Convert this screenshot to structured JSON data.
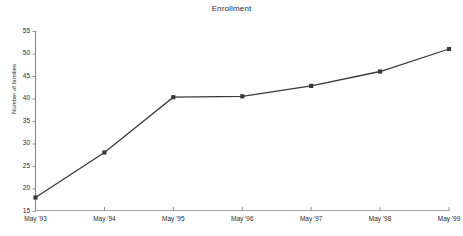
{
  "chart_data": {
    "type": "line",
    "title": "Enrollment",
    "xlabel": "",
    "ylabel": "Number of families",
    "categories": [
      "May '93",
      "May '94",
      "May '95",
      "May '96",
      "May '97",
      "May '98",
      "May '99"
    ],
    "values": [
      18,
      28,
      40.3,
      40.5,
      42.8,
      46,
      51
    ],
    "ylim": [
      15,
      55
    ],
    "yticks": [
      15,
      20,
      25,
      30,
      35,
      40,
      45,
      50,
      55
    ],
    "grid": false,
    "legend": null,
    "series_color": "#3a3a3a",
    "marker": "square"
  }
}
